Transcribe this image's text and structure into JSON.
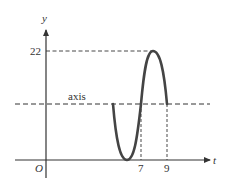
{
  "diagram": {
    "type": "sinusoid-graph",
    "axes": {
      "x_label": "t",
      "y_label": "y",
      "origin_label": "O"
    },
    "y_ticks": [
      {
        "label": "22",
        "value": 22
      }
    ],
    "x_ticks": [
      {
        "label": "7",
        "value": 7
      },
      {
        "label": "9",
        "value": 9
      }
    ],
    "reference_line": {
      "label": "axis",
      "style": "dashed"
    },
    "curve": {
      "description": "one period of a sinusoid starting at the axis, dipping to a minimum on the t-axis, crossing the axis at t=7, reaching maximum 22, returning to the axis at t=9",
      "max_value": 22,
      "min_value": 0,
      "axis_crossings": [
        7,
        9
      ]
    },
    "colors": {
      "curve": "#444444",
      "axes": "#333333",
      "dashed": "#333333"
    }
  }
}
